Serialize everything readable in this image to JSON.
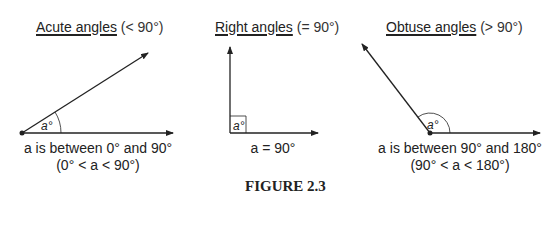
{
  "panels": [
    {
      "title_underlined": "Acute angles",
      "title_rest": " (< 90°)",
      "angle_label": "a°",
      "caption_line1": "a is between 0° and 90°",
      "caption_line2": "(0° < a < 90°)"
    },
    {
      "title_underlined": "Right angles",
      "title_rest": " (= 90°)",
      "angle_label": "a°",
      "caption_line1": "a = 90°"
    },
    {
      "title_underlined": "Obtuse angles",
      "title_rest": " (> 90°)",
      "angle_label": "a°",
      "caption_line1": "a is between 90° and 180°",
      "caption_line2": "(90° < a < 180°)"
    }
  ],
  "figure_caption": "FIGURE 2.3",
  "colors": {
    "line": "#222222",
    "text": "#222222"
  }
}
